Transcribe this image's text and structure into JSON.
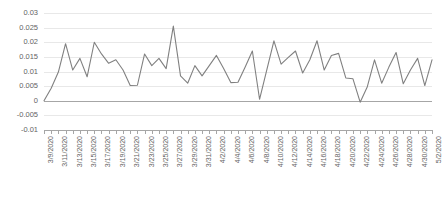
{
  "chart_data": {
    "type": "line",
    "title": "",
    "xlabel": "",
    "ylabel": "",
    "ylim": [
      -0.01,
      0.03
    ],
    "ytick_values": [
      0.03,
      0.025,
      0.02,
      0.015,
      0.01,
      0.005,
      0,
      -0.005,
      -0.01
    ],
    "ytick_labels": [
      "0.03",
      "0.025",
      "0.02",
      "0.015",
      "0.01",
      "0.005",
      "0",
      "-0.005",
      "-0.01"
    ],
    "grid": true,
    "legend": "none",
    "line_color": "#808080",
    "axis_color": "#a6a6a6",
    "grid_color": "#e8e8e8",
    "tick_label_color": "#636363",
    "xtick_label_rotation": -90,
    "xtick_label_every": 2,
    "x": [
      "3/9/2020",
      "3/10/2020",
      "3/11/2020",
      "3/12/2020",
      "3/13/2020",
      "3/14/2020",
      "3/15/2020",
      "3/16/2020",
      "3/17/2020",
      "3/18/2020",
      "3/19/2020",
      "3/20/2020",
      "3/21/2020",
      "3/22/2020",
      "3/23/2020",
      "3/24/2020",
      "3/25/2020",
      "3/26/2020",
      "3/27/2020",
      "3/28/2020",
      "3/29/2020",
      "3/30/2020",
      "3/31/2020",
      "4/1/2020",
      "4/2/2020",
      "4/3/2020",
      "4/4/2020",
      "4/5/2020",
      "4/6/2020",
      "4/7/2020",
      "4/8/2020",
      "4/9/2020",
      "4/10/2020",
      "4/11/2020",
      "4/12/2020",
      "4/13/2020",
      "4/14/2020",
      "4/15/2020",
      "4/16/2020",
      "4/17/2020",
      "4/18/2020",
      "4/19/2020",
      "4/20/2020",
      "4/21/2020",
      "4/22/2020",
      "4/23/2020",
      "4/24/2020",
      "4/25/2020",
      "4/26/2020",
      "4/27/2020",
      "4/28/2020",
      "4/29/2020",
      "4/30/2020",
      "5/1/2020",
      "5/2/2020"
    ],
    "xtick_labels": [
      "3/9/2020",
      "3/11/2020",
      "3/13/2020",
      "3/15/2020",
      "3/17/2020",
      "3/19/2020",
      "3/21/2020",
      "3/23/2020",
      "3/25/2020",
      "3/27/2020",
      "3/29/2020",
      "3/31/2020",
      "4/2/2020",
      "4/4/2020",
      "4/6/2020",
      "4/8/2020",
      "4/10/2020",
      "4/12/2020",
      "4/14/2020",
      "4/16/2020",
      "4/18/2020",
      "4/20/2020",
      "4/22/2020",
      "4/24/2020",
      "4/26/2020",
      "4/28/2020",
      "4/30/2020",
      "5/2/2020"
    ],
    "values": [
      0.0,
      0.0043,
      0.0098,
      0.0195,
      0.0105,
      0.0145,
      0.0082,
      0.02,
      0.016,
      0.0128,
      0.014,
      0.0105,
      0.0052,
      0.0053,
      0.016,
      0.012,
      0.0145,
      0.011,
      0.0255,
      0.0085,
      0.006,
      0.012,
      0.0085,
      0.012,
      0.0155,
      0.011,
      0.0062,
      0.0063,
      0.0115,
      0.017,
      0.0005,
      0.0105,
      0.0205,
      0.0125,
      0.0148,
      0.017,
      0.0095,
      0.014,
      0.0205,
      0.0105,
      0.0155,
      0.0162,
      0.0078,
      0.0075,
      -0.0005,
      0.0048,
      0.014,
      0.006,
      0.0115,
      0.0165,
      0.0058,
      0.0105,
      0.0145,
      0.0052,
      0.014
    ]
  }
}
